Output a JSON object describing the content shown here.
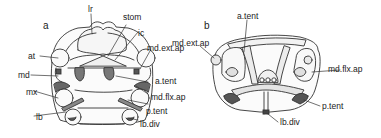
{
  "figure": {
    "panels": [
      {
        "id": "a",
        "label": "a",
        "annotations": {
          "lr": "lr",
          "stom": "stom",
          "ic": "ic",
          "at": "at",
          "md_ext_ap": "md.ext.ap",
          "md": "md",
          "a_tent": "a.tent",
          "mx": "mx",
          "md_flx_ap": "md.flx.ap",
          "lb": "lb",
          "p_tent": "p.tent",
          "lb_div": "lb.div"
        }
      },
      {
        "id": "b",
        "label": "b",
        "annotations": {
          "a_tent": "a.tent",
          "md_ext_ap": "md.ext.ap",
          "md_flx_ap": "md.flx.ap",
          "p_tent": "p.tent",
          "lb_div": "lb.div"
        }
      }
    ],
    "colors": {
      "line": "#333333",
      "fill_dark": "#555555",
      "fill_light": "#f4f4f4",
      "background": "#ffffff"
    }
  }
}
